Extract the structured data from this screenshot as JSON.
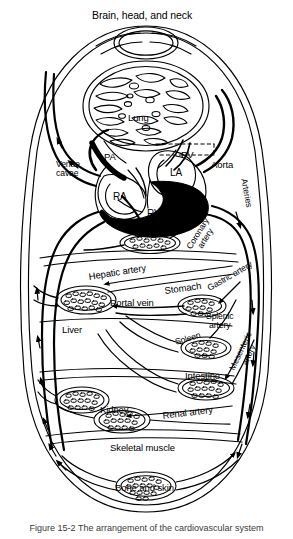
{
  "figure": {
    "title": "Brain, head, and neck",
    "caption_partial": "Figure 15-2   The arrangement of the cardiovascular system"
  },
  "labels": {
    "brain_head_neck": "Brain, head, and neck",
    "lung": "Lung",
    "pa": "PA",
    "pv": "PV",
    "aorta": "Aorta",
    "venae_cavae": "Venae\ncavae",
    "venae_cavae_line1": "Venae",
    "venae_cavae_line2": "cavae",
    "ra": "RA",
    "rv": "RV",
    "la": "LA",
    "lv": "LV",
    "arteries": "Arteries",
    "coronary_artery_line1": "Coronary",
    "coronary_artery_line2": "artery",
    "hepatic_artery": "Hepatic artery",
    "stomach": "Stomach",
    "gastric_artery": "Gastric artery",
    "portal_vein": "Portal vein",
    "liver": "Liver",
    "splenic_artery_line1": "Splenic",
    "splenic_artery_line2": "artery",
    "spleen": "Spleen",
    "mesenteric_artery_line1": "Mesenteric",
    "mesenteric_artery_line2": "artery",
    "intestine": "Intestine",
    "kidney": "Kidney",
    "renal_artery": "Renal artery",
    "skeletal_muscle": "Skeletal muscle",
    "bone_and_skin": "Bone and skin"
  },
  "colors": {
    "ink": "#000000",
    "background": "#ffffff",
    "oxygenated_fill": "#000000",
    "caption_text": "#3a3a3a"
  }
}
